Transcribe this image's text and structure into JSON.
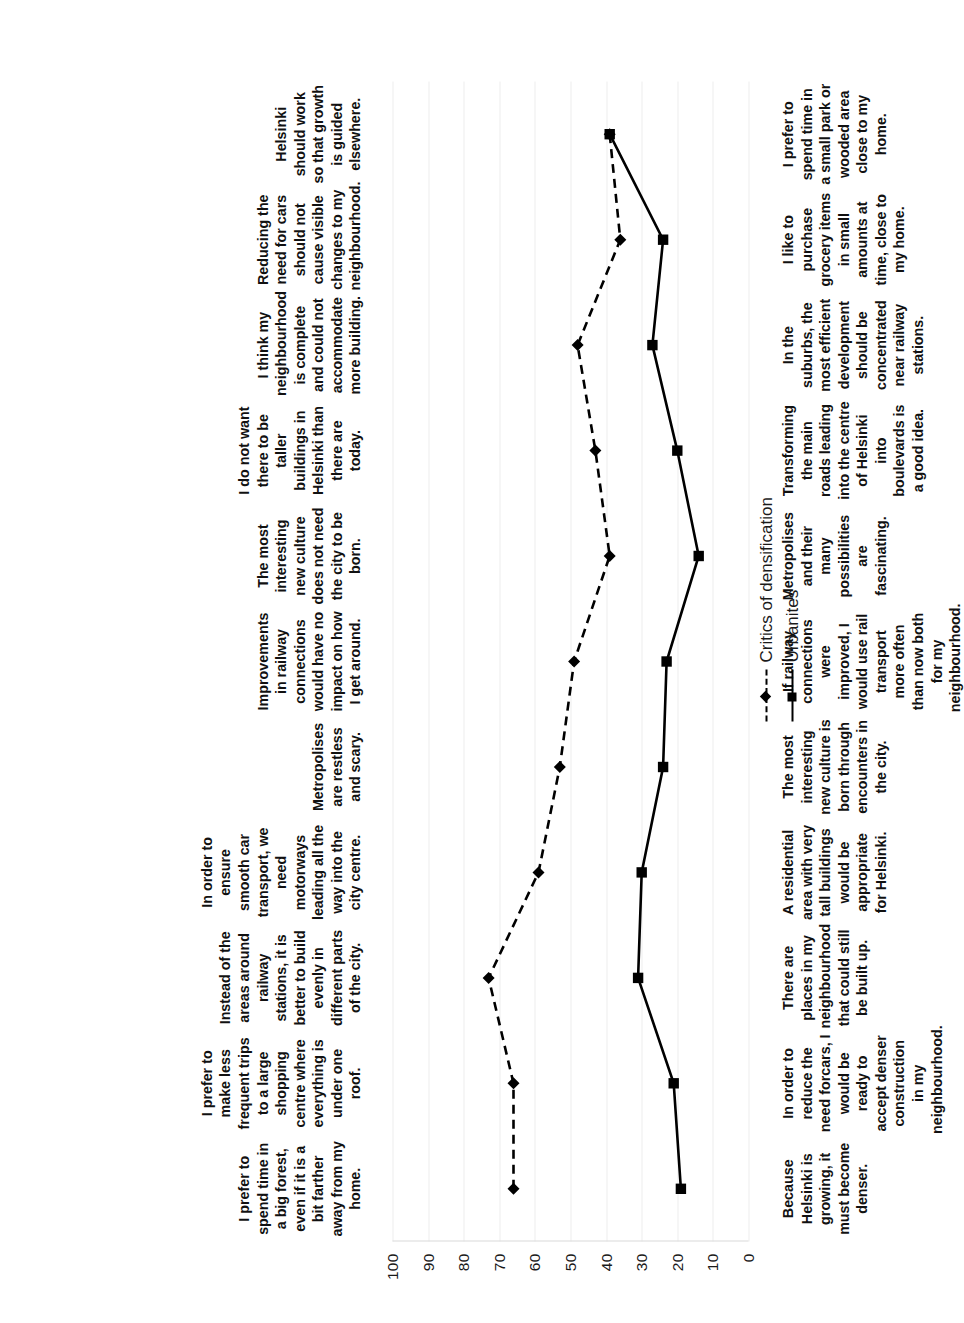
{
  "chart_data": {
    "type": "line",
    "title": "",
    "xlabel": "",
    "ylabel": "",
    "ylim": [
      0,
      100
    ],
    "grid": true,
    "legend_position": "bottom-right",
    "orientation": "rotated-90",
    "tick_labels": [
      "0",
      "10",
      "20",
      "30",
      "40",
      "50",
      "60",
      "70",
      "80",
      "90",
      "100"
    ],
    "tick_values": [
      0,
      10,
      20,
      30,
      40,
      50,
      60,
      70,
      80,
      90,
      100
    ],
    "categories": [
      "Because Helsinki is growing, it must become denser.",
      "In order to reduce the need forcars, I would be ready to accept denser construction in my neighbourhood.",
      "There are places in my neighbourhood that could still be built up.",
      "A residential area with very tall buildings would be appropriate for Helsinki.",
      "The most interesting new culture is born through encounters in the city.",
      "If railway connections were improved, I would use rail transport more often than now both for my neighbourhood.",
      "Metropolises and their many possibilities are fascinating.",
      "Transforming the main roads leading into the centre of Helsinki into boulevards is a good idea.",
      "In the suburbs, the most efficient development should be concentrated near railway stations.",
      "I like to purchase grocery items in small amounts at time, close to my home.",
      "I prefer to spend time in a small park or wooded area close to my home."
    ],
    "categories_opposite": [
      "I prefer to spend time in a big forest, even if it is a bit farther away from my home.",
      "I prefer to make less frequent trips to a large shopping centre where everything is under one roof.",
      "Instead of the areas around railway stations, it is better to build evenly in different parts of the city.",
      "In order to ensure smooth car transport, we need motorways leading all the way into the city centre.",
      "Metropolises are restless and scary.",
      "Improvements in railway connections would have no impact on how I get around.",
      "The most interesting new culture does not need the city to be born.",
      "I do not want there to be taller buildings in Helsinki than there are today.",
      "I think my neighbourhood is complete and could not accommodate more building.",
      "Reducing the need for cars should not cause visible changes to my neighbourhood.",
      "Helsinki should work so that growth is guided elsewhere."
    ],
    "series": [
      {
        "name": "Critics of densification",
        "style": "dashed",
        "marker": "diamond",
        "color": "#000000",
        "values": [
          66,
          66,
          73,
          59,
          53,
          49,
          39,
          43,
          48,
          36,
          39
        ]
      },
      {
        "name": "Urbanites",
        "style": "solid",
        "marker": "square",
        "color": "#000000",
        "values": [
          19,
          21,
          31,
          30,
          24,
          23,
          14,
          20,
          27,
          24,
          39
        ]
      }
    ]
  },
  "legend": {
    "items": [
      {
        "label": "Critics of densification"
      },
      {
        "label": "Urbanites"
      }
    ]
  }
}
